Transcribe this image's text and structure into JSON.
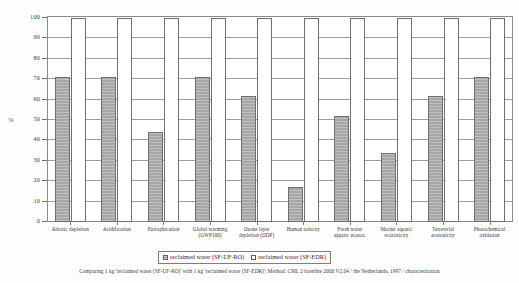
{
  "chart_data": {
    "type": "bar",
    "title": "",
    "xlabel": "",
    "ylabel": "%",
    "ylim": [
      0,
      100
    ],
    "yticks": [
      0,
      10,
      20,
      30,
      40,
      50,
      60,
      70,
      80,
      90,
      100
    ],
    "grid": true,
    "legend_position": "bottom-center",
    "categories": [
      "Abiotic depletion",
      "Acidification",
      "Eutrophication",
      "Global warming (GWP100)",
      "Ozone layer depletion (ODP)",
      "Human toxicity",
      "Fresh water aquatic ecotox.",
      "Marine aquatic ecotoxicity",
      "Terrestrial ecotoxicity",
      "Photochemical oxidation"
    ],
    "series": [
      {
        "name": "reclaimed water (SF-UF-RO)",
        "values": [
          71,
          71,
          44,
          71,
          62,
          17,
          52,
          34,
          62,
          71
        ]
      },
      {
        "name": "reclaimed water (SF-EDR)",
        "values": [
          100,
          100,
          100,
          100,
          100,
          100,
          100,
          100,
          100,
          100
        ]
      }
    ]
  },
  "axis": {
    "y_title": "%",
    "y_tick_labels": [
      "100",
      "90",
      "80",
      "70",
      "60",
      "50",
      "40",
      "30",
      "20",
      "10",
      "0"
    ],
    "x_tick_labels": [
      {
        "line1": "Abiotic depletion",
        "line2": ""
      },
      {
        "line1": "Acidification",
        "line2": ""
      },
      {
        "line1": "Eutrophication",
        "line2": ""
      },
      {
        "line1": "Global warming",
        "line2": "(GWP100)"
      },
      {
        "line1": "Ozone layer",
        "line2": "depletion (ODP)"
      },
      {
        "line1": "Human toxicity",
        "line2": ""
      },
      {
        "line1": "Fresh water",
        "line2": "aquatic ecotox."
      },
      {
        "line1": "Marine aquatic",
        "line2": "ecotoxicity"
      },
      {
        "line1": "Terrestrial",
        "line2": "ecotoxicity"
      },
      {
        "line1": "Photochemical",
        "line2": "oxidation"
      }
    ]
  },
  "legend": {
    "items": [
      {
        "label": "reclaimed water (SF-UF-RO)",
        "style": "hatched-gray"
      },
      {
        "label": "reclaimed water (SF-EDR)",
        "style": "open-white"
      }
    ]
  },
  "caption": {
    "text": "Comparing 1 kg 'reclaimed water (SF-UF-RO)' with 1 kg 'reclaimed water (SF-EDR)'; Method: CML 2 baseline 2000 V2.04 / the Netherlands, 1997 / characterization"
  },
  "colors": {
    "series_a_fill": "#a6a6a6",
    "series_b_fill": "#ffffff",
    "bar_outline": "#6f6f6f",
    "grid": "#9d9d9d",
    "frame": "#8a8a8a",
    "background": "#fdfdfd",
    "text": "#333333"
  }
}
